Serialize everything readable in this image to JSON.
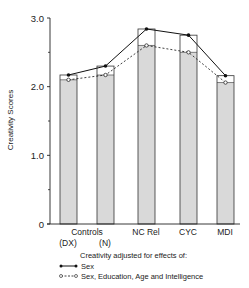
{
  "chart_data": {
    "type": "bar",
    "title": "",
    "xlabel": "",
    "ylabel": "Creativity Scores",
    "ylim": [
      0,
      3.0
    ],
    "yticks": [
      "0",
      "1.0",
      "2.0",
      "3.0"
    ],
    "minor_yticks": [
      0.5,
      1.5,
      2.5
    ],
    "grid": false,
    "categories": [
      "Controls (DX)",
      "Controls (N)",
      "NC Rel",
      "CYC",
      "MDI"
    ],
    "category_labels": {
      "group": "Controls",
      "sub": [
        "(DX)",
        "(N)"
      ],
      "others": [
        "NC Rel",
        "CYC",
        "MDI"
      ]
    },
    "series": [
      {
        "name": "Sex",
        "style": "solid line, filled circle markers; outer bar height",
        "values": [
          2.17,
          2.3,
          2.84,
          2.75,
          2.16
        ]
      },
      {
        "name": "Sex, Education, Age and Intelligence",
        "style": "dashed line, open circle markers; shaded bar height",
        "values": [
          2.1,
          2.17,
          2.6,
          2.5,
          2.06
        ]
      }
    ],
    "legend": {
      "title": "Creativity adjusted for effects of:",
      "entries": [
        "Sex",
        "Sex, Education, Age and Intelligence"
      ],
      "position": "bottom"
    },
    "colors": {
      "line": "#111111",
      "bar_fill": "#d9d9d9",
      "bar_outline": "#333333"
    }
  }
}
